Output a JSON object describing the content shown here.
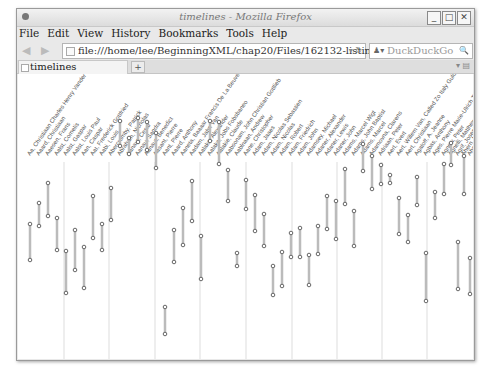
{
  "window": {
    "title": "timelines - Mozilla Firefox",
    "controls": [
      "minimize",
      "maximize",
      "close"
    ]
  },
  "menubar": {
    "items": [
      "File",
      "Edit",
      "View",
      "History",
      "Bookmarks",
      "Tools",
      "Help"
    ]
  },
  "navbar": {
    "back_icon": "back-arrow-icon",
    "forward_icon": "forward-arrow-icon",
    "url": "file:///home/lee/BeginningXML/chap20/Files/162132-listing20-08.svg",
    "search_placeholder": "DuckDuckGo"
  },
  "tabs": [
    {
      "label": "timelines",
      "active": true
    }
  ],
  "new_tab_label": "+",
  "colors": {
    "bar": "#bbbbbb",
    "endpoint": "#666666",
    "gridline": "#dddddd",
    "label": "#555555"
  },
  "chart_data": {
    "type": "timeline",
    "title": "timelines",
    "gridlines_x": [
      46,
      91,
      137,
      182,
      228,
      274,
      319,
      364,
      409
    ],
    "bars": [
      {
        "label": "Aa, Christiaan Charles Henry Vander",
        "x": 12,
        "y1": 150,
        "y2": 186
      },
      {
        "label": "Aaard, Christiaan",
        "x": 21,
        "y1": 129,
        "y2": 152
      },
      {
        "label": "Aaesen, Frans",
        "x": 30,
        "y1": 109,
        "y2": 142
      },
      {
        "label": "Aalst, Cornelis",
        "x": 39,
        "y1": 144,
        "y2": 176
      },
      {
        "label": "Aalst, Gaspar",
        "x": 48,
        "y1": 177,
        "y2": 219
      },
      {
        "label": "Aalst, Louis Paul",
        "x": 57,
        "y1": 156,
        "y2": 196
      },
      {
        "label": "Aan, Caspar",
        "x": 66,
        "y1": 173,
        "y2": 214
      },
      {
        "label": "Aat, Frederick Gottfried",
        "x": 75,
        "y1": 122,
        "y2": 164
      },
      {
        "label": "Aabi, Louis",
        "x": 84,
        "y1": 150,
        "y2": 176
      },
      {
        "label": "Abercromby, Patrick",
        "x": 93,
        "y1": 114,
        "y2": 146
      },
      {
        "label": "Abraham, Nicholas",
        "x": 102,
        "y1": 47,
        "y2": 72
      },
      {
        "label": "Aanaut, Cesar",
        "x": 111,
        "y1": 64,
        "y2": 80
      },
      {
        "label": "Aanau, Sandra",
        "x": 120,
        "y1": 44,
        "y2": 68
      },
      {
        "label": "Aanaut, Benedict",
        "x": 129,
        "y1": 48,
        "y2": 76
      },
      {
        "label": "Aasant, Pierre",
        "x": 138,
        "y1": 59,
        "y2": 94
      },
      {
        "label": "Aant, Pierre",
        "x": 147,
        "y1": 233,
        "y2": 260
      },
      {
        "label": "Aaard, Anthony",
        "x": 156,
        "y1": 156,
        "y2": 188
      },
      {
        "label": "Aaneta, Baaaar Francis De La Beuve",
        "x": 165,
        "y1": 134,
        "y2": 171
      },
      {
        "label": "Aadam, Jabn Van",
        "x": 174,
        "y1": 107,
        "y2": 147
      },
      {
        "label": "Aalaka, Alexander",
        "x": 183,
        "y1": 162,
        "y2": 205
      },
      {
        "label": "Aalaka, Jobs Fobsbaneo",
        "x": 192,
        "y1": 47,
        "y2": 67
      },
      {
        "label": "Aalakie, Claude",
        "x": 201,
        "y1": 48,
        "y2": 90
      },
      {
        "label": "Aabsonam, John Christian Gottlieb",
        "x": 210,
        "y1": 96,
        "y2": 127
      },
      {
        "label": "Aablnaan, Andrew",
        "x": 219,
        "y1": 179,
        "y2": 192
      },
      {
        "label": "Aane, Christopher",
        "x": 228,
        "y1": 106,
        "y2": 135
      },
      {
        "label": "Adam, Jaaes",
        "x": 237,
        "y1": 121,
        "y2": 157
      },
      {
        "label": "Adam, Nicolas Sebastien",
        "x": 246,
        "y1": 140,
        "y2": 172
      },
      {
        "label": "Adam, Nicolas",
        "x": 255,
        "y1": 192,
        "y2": 221
      },
      {
        "label": "Adam, Robert",
        "x": 264,
        "y1": 178,
        "y2": 212
      },
      {
        "label": "Adam, Friedrich",
        "x": 273,
        "y1": 159,
        "y2": 183
      },
      {
        "label": "Adam, John",
        "x": 282,
        "y1": 154,
        "y2": 183
      },
      {
        "label": "Adamsey, Michael",
        "x": 291,
        "y1": 181,
        "y2": 211
      },
      {
        "label": "Adaner, Alexander",
        "x": 300,
        "y1": 152,
        "y2": 180
      },
      {
        "label": "Adaner, Lewis",
        "x": 309,
        "y1": 122,
        "y2": 155
      },
      {
        "label": "Adaner, John",
        "x": 318,
        "y1": 127,
        "y2": 165
      },
      {
        "label": "Adams, Marcel Wigt",
        "x": 327,
        "y1": 95,
        "y2": 130
      },
      {
        "label": "Adams, John Baptist",
        "x": 336,
        "y1": 137,
        "y2": 172
      },
      {
        "label": "Adams, Marcel",
        "x": 345,
        "y1": 70,
        "y2": 97
      },
      {
        "label": "Adamovna, Clarens",
        "x": 354,
        "y1": 82,
        "y2": 115
      },
      {
        "label": "Adriaan, Peter",
        "x": 363,
        "y1": 91,
        "y2": 110
      },
      {
        "label": "Aert, Evert",
        "x": 372,
        "y1": 101,
        "y2": 109
      },
      {
        "label": "Aert, Willem Van, Called Zo Italy Guld",
        "x": 381,
        "y1": 124,
        "y2": 160
      },
      {
        "label": "Aert, Christiaan",
        "x": 390,
        "y1": 141,
        "y2": 168
      },
      {
        "label": "Agatoff, A. Jeanne",
        "x": 399,
        "y1": 103,
        "y2": 131
      },
      {
        "label": "Agbas, Anthony",
        "x": 408,
        "y1": 179,
        "y2": 227
      },
      {
        "label": "Ages, Pierre Marie-Ulrich Theodore",
        "x": 417,
        "y1": 118,
        "y2": 144
      },
      {
        "label": "Agnew, Peter",
        "x": 426,
        "y1": 90,
        "y2": 120
      },
      {
        "label": "Agnelli, Matthew",
        "x": 433,
        "y1": 69,
        "y2": 91
      },
      {
        "label": "Agrif, Joseph",
        "x": 440,
        "y1": 168,
        "y2": 215
      },
      {
        "label": "Ahern, Maria",
        "x": 446,
        "y1": 82,
        "y2": 120
      },
      {
        "label": "Ahn, Nicolas",
        "x": 452,
        "y1": 184,
        "y2": 220
      }
    ]
  }
}
